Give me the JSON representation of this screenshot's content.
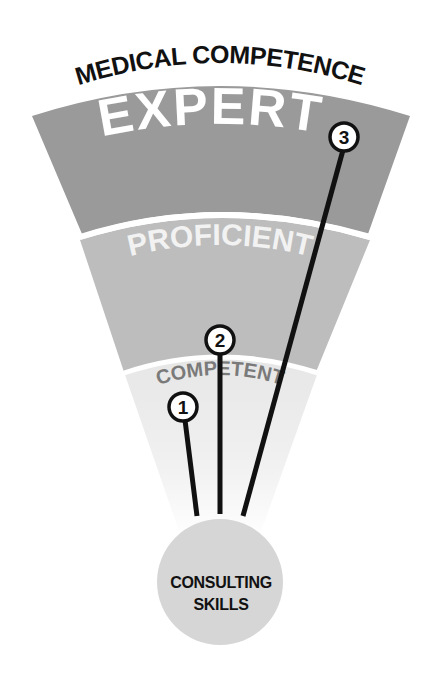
{
  "diagram": {
    "title": "MEDICAL COMPETENCE",
    "levels": [
      {
        "label": "EXPERT",
        "color": "#9a9a9a"
      },
      {
        "label": "PROFICIENT",
        "color": "#bdbdbd"
      },
      {
        "label": "COMPETENT",
        "color": "#e4e4e4"
      }
    ],
    "markers": [
      {
        "number": "1",
        "level": "COMPETENT"
      },
      {
        "number": "2",
        "level": "PROFICIENT"
      },
      {
        "number": "3",
        "level": "EXPERT"
      }
    ],
    "core": {
      "line1": "CONSULTING",
      "line2": "SKILLS",
      "color": "#d6d6d6"
    }
  }
}
